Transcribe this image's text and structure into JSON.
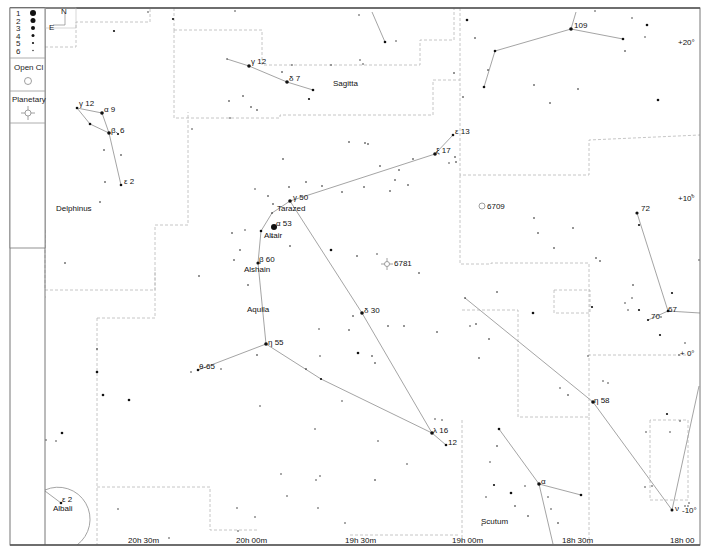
{
  "legend": {
    "magnitudes": [
      {
        "label": "1",
        "r": 3.0
      },
      {
        "label": "2",
        "r": 2.5
      },
      {
        "label": "3",
        "r": 2.0
      },
      {
        "label": "4",
        "r": 1.5
      },
      {
        "label": "5",
        "r": 1.1
      },
      {
        "label": "6",
        "r": 0.7
      }
    ],
    "open_cluster_label": "Open Cl",
    "planetary_label": "Planetary",
    "compass": {
      "north": "N",
      "east": "E"
    }
  },
  "axes": {
    "ra_labels": [
      {
        "text": "20h 30m",
        "x": 128,
        "y": 543
      },
      {
        "text": "20h 00m",
        "x": 236,
        "y": 543
      },
      {
        "text": "19h 30m",
        "x": 345,
        "y": 543
      },
      {
        "text": "19h 00m",
        "x": 452,
        "y": 543
      },
      {
        "text": "18h 30m",
        "x": 562,
        "y": 543
      },
      {
        "text": "18h 00",
        "x": 670,
        "y": 543
      }
    ],
    "dec_labels": [
      {
        "text": "+20°",
        "x": 678,
        "y": 45
      },
      {
        "text": "+10°",
        "x": 678,
        "y": 201
      },
      {
        "text": "+ 0°",
        "x": 680,
        "y": 356
      },
      {
        "text": "-10°",
        "x": 682,
        "y": 513
      }
    ]
  },
  "constellations": [
    {
      "name": "Delphinus",
      "x": 56,
      "y": 211
    },
    {
      "name": "Sagitta",
      "x": 333,
      "y": 86
    },
    {
      "name": "Aquila",
      "x": 247,
      "y": 312
    },
    {
      "name": "Scutum",
      "x": 481,
      "y": 524
    }
  ],
  "star_labels": [
    {
      "text": "γ 12",
      "x": 79,
      "y": 106
    },
    {
      "text": "α  9",
      "x": 104,
      "y": 112
    },
    {
      "text": "β. 6",
      "x": 111,
      "y": 133
    },
    {
      "text": "ε 2",
      "x": 124,
      "y": 184
    },
    {
      "text": "γ 12",
      "x": 251,
      "y": 64
    },
    {
      "text": "δ  7",
      "x": 289,
      "y": 81
    },
    {
      "text": "109",
      "x": 574,
      "y": 28
    },
    {
      "text": "ε 13",
      "x": 455,
      "y": 134
    },
    {
      "text": "ξ  17",
      "x": 436,
      "y": 153
    },
    {
      "text": "γ 50",
      "x": 293,
      "y": 200
    },
    {
      "text": "Tarazed",
      "x": 277,
      "y": 211
    },
    {
      "text": "α  53",
      "x": 276,
      "y": 226
    },
    {
      "text": "Altair",
      "x": 264,
      "y": 238
    },
    {
      "text": "β  60",
      "x": 259,
      "y": 262
    },
    {
      "text": "Alshain",
      "x": 244,
      "y": 272
    },
    {
      "text": "6709",
      "x": 487,
      "y": 209
    },
    {
      "text": "6781",
      "x": 394,
      "y": 266
    },
    {
      "text": "72",
      "x": 641,
      "y": 211
    },
    {
      "text": "67",
      "x": 668,
      "y": 312
    },
    {
      "text": "70",
      "x": 651,
      "y": 319
    },
    {
      "text": "δ  30",
      "x": 364,
      "y": 313
    },
    {
      "text": "η  55",
      "x": 268,
      "y": 345
    },
    {
      "text": "θ-65",
      "x": 199,
      "y": 369
    },
    {
      "text": "η  58",
      "x": 594,
      "y": 403
    },
    {
      "text": "λ  16",
      "x": 433,
      "y": 433
    },
    {
      "text": "12",
      "x": 448,
      "y": 445
    },
    {
      "text": "α",
      "x": 541,
      "y": 484
    },
    {
      "text": "ε 2",
      "x": 62,
      "y": 502
    },
    {
      "text": "Albali",
      "x": 53,
      "y": 511
    },
    {
      "text": "ν",
      "x": 675,
      "y": 511
    }
  ],
  "deep_sky": [
    {
      "type": "open-cluster",
      "id": "6709",
      "x": 482,
      "y": 206
    },
    {
      "type": "planetary-nebula",
      "id": "6781",
      "x": 387,
      "y": 264
    }
  ],
  "stars": [
    [
      77,
      108,
      1.3
    ],
    [
      102,
      113,
      1.8
    ],
    [
      90,
      124,
      1.3
    ],
    [
      109,
      133,
      1.8
    ],
    [
      118,
      134,
      1.1
    ],
    [
      104,
      150,
      0.8
    ],
    [
      121,
      155,
      0.8
    ],
    [
      121,
      185,
      1.3
    ],
    [
      105,
      182,
      0.8
    ],
    [
      100,
      202,
      0.8
    ],
    [
      65,
      263,
      0.8
    ],
    [
      114,
      31,
      1.1
    ],
    [
      148,
      12,
      0.7
    ],
    [
      227,
      59,
      0.7
    ],
    [
      249,
      66,
      1.8
    ],
    [
      287,
      82,
      1.8
    ],
    [
      313,
      90,
      1.3
    ],
    [
      282,
      72,
      0.8
    ],
    [
      309,
      99,
      1.1
    ],
    [
      229,
      101,
      0.8
    ],
    [
      243,
      96,
      0.8
    ],
    [
      251,
      107,
      0.8
    ],
    [
      257,
      110,
      0.8
    ],
    [
      230,
      118,
      0.7
    ],
    [
      192,
      129,
      0.7
    ],
    [
      173,
      19,
      1.1
    ],
    [
      235,
      11,
      0.7
    ],
    [
      385,
      42,
      1.3
    ],
    [
      396,
      41,
      0.7
    ],
    [
      359,
      15,
      0.7
    ],
    [
      331,
      65,
      0.7
    ],
    [
      360,
      60,
      0.7
    ],
    [
      363,
      64,
      0.7
    ],
    [
      292,
      65,
      0.7
    ],
    [
      467,
      20,
      1.3
    ],
    [
      475,
      38,
      0.8
    ],
    [
      488,
      70,
      0.8
    ],
    [
      495,
      51,
      1.3
    ],
    [
      484,
      87,
      1.3
    ],
    [
      571,
      29,
      1.8
    ],
    [
      623,
      39,
      1.3
    ],
    [
      632,
      18,
      0.7
    ],
    [
      647,
      25,
      1.3
    ],
    [
      645,
      37,
      0.7
    ],
    [
      625,
      51,
      0.8
    ],
    [
      658,
      100,
      1.3
    ],
    [
      534,
      85,
      0.8
    ],
    [
      578,
      89,
      0.8
    ],
    [
      550,
      103,
      0.8
    ],
    [
      463,
      97,
      0.8
    ],
    [
      454,
      73,
      0.8
    ],
    [
      595,
      11,
      0.7
    ],
    [
      453,
      135,
      1.3
    ],
    [
      435,
      154,
      1.8
    ],
    [
      455,
      157,
      0.8
    ],
    [
      456,
      162,
      0.8
    ],
    [
      449,
      163,
      0.7
    ],
    [
      413,
      159,
      0.8
    ],
    [
      399,
      170,
      0.8
    ],
    [
      395,
      180,
      0.8
    ],
    [
      349,
      142,
      0.8
    ],
    [
      368,
      144,
      0.8
    ],
    [
      365,
      143,
      0.8
    ],
    [
      380,
      166,
      0.8
    ],
    [
      283,
      159,
      0.8
    ],
    [
      289,
      187,
      0.8
    ],
    [
      306,
      182,
      0.8
    ],
    [
      408,
      185,
      0.8
    ],
    [
      390,
      191,
      0.8
    ],
    [
      364,
      187,
      0.8
    ],
    [
      322,
      186,
      0.8
    ],
    [
      342,
      192,
      0.8
    ],
    [
      290,
      201,
      1.8
    ],
    [
      273,
      204,
      0.8
    ],
    [
      268,
      196,
      0.8
    ],
    [
      255,
      189,
      0.7
    ],
    [
      272,
      213,
      0.8
    ],
    [
      272,
      237,
      0.7
    ],
    [
      261,
      231,
      1.3
    ],
    [
      245,
      230,
      0.7
    ],
    [
      274,
      227,
      3.0
    ],
    [
      258,
      263,
      1.6
    ],
    [
      240,
      250,
      0.8
    ],
    [
      234,
      260,
      0.8
    ],
    [
      290,
      246,
      0.8
    ],
    [
      331,
      250,
      1.3
    ],
    [
      357,
      256,
      0.8
    ],
    [
      377,
      254,
      0.7
    ],
    [
      419,
      273,
      0.8
    ],
    [
      248,
      285,
      0.8
    ],
    [
      199,
      276,
      0.8
    ],
    [
      232,
      233,
      0.8
    ],
    [
      534,
      218,
      0.8
    ],
    [
      573,
      228,
      0.8
    ],
    [
      497,
      292,
      0.8
    ],
    [
      538,
      233,
      0.8
    ],
    [
      554,
      248,
      0.8
    ],
    [
      600,
      261,
      0.8
    ],
    [
      637,
      213,
      1.6
    ],
    [
      639,
      225,
      1.1
    ],
    [
      596,
      258,
      0.8
    ],
    [
      633,
      285,
      0.8
    ],
    [
      639,
      310,
      1.1
    ],
    [
      668,
      311,
      1.3
    ],
    [
      648,
      320,
      1.1
    ],
    [
      625,
      303,
      0.7
    ],
    [
      628,
      310,
      0.7
    ],
    [
      632,
      298,
      0.7
    ],
    [
      592,
      307,
      1.1
    ],
    [
      672,
      293,
      1.1
    ],
    [
      661,
      317,
      0.7
    ],
    [
      660,
      335,
      1.1
    ],
    [
      679,
      355,
      0.7
    ],
    [
      685,
      343,
      0.7
    ],
    [
      692,
      195,
      0.7
    ],
    [
      699,
      260,
      0.7
    ],
    [
      465,
      298,
      0.8
    ],
    [
      476,
      324,
      0.8
    ],
    [
      470,
      326,
      0.7
    ],
    [
      489,
      339,
      0.8
    ],
    [
      479,
      358,
      0.8
    ],
    [
      533,
      313,
      1.3
    ],
    [
      568,
      395,
      0.8
    ],
    [
      588,
      356,
      0.7
    ],
    [
      603,
      381,
      0.7
    ],
    [
      608,
      383,
      0.7
    ],
    [
      362,
      313,
      1.8
    ],
    [
      353,
      316,
      0.8
    ],
    [
      349,
      330,
      0.8
    ],
    [
      388,
      326,
      0.8
    ],
    [
      358,
      353,
      1.3
    ],
    [
      372,
      356,
      0.8
    ],
    [
      375,
      363,
      0.8
    ],
    [
      404,
      326,
      0.8
    ],
    [
      437,
      332,
      0.8
    ],
    [
      319,
      329,
      0.7
    ],
    [
      320,
      356,
      0.7
    ],
    [
      266,
      344,
      1.8
    ],
    [
      257,
      355,
      0.8
    ],
    [
      306,
      369,
      0.8
    ],
    [
      321,
      379,
      1.1
    ],
    [
      342,
      401,
      0.7
    ],
    [
      198,
      370,
      1.3
    ],
    [
      191,
      372,
      0.7
    ],
    [
      221,
      369,
      0.7
    ],
    [
      260,
      406,
      0.7
    ],
    [
      315,
      429,
      0.7
    ],
    [
      378,
      441,
      0.7
    ],
    [
      432,
      433,
      1.8
    ],
    [
      446,
      445,
      1.3
    ],
    [
      442,
      420,
      0.7
    ],
    [
      435,
      419,
      0.7
    ],
    [
      97,
      349,
      0.8
    ],
    [
      97,
      372,
      1.3
    ],
    [
      103,
      395,
      1.3
    ],
    [
      129,
      400,
      1.3
    ],
    [
      62,
      433,
      1.3
    ],
    [
      56,
      441,
      0.7
    ],
    [
      46,
      440,
      0.7
    ],
    [
      593,
      402,
      1.8
    ],
    [
      560,
      388,
      0.7
    ],
    [
      667,
      414,
      1.1
    ],
    [
      680,
      421,
      0.7
    ],
    [
      646,
      432,
      0.7
    ],
    [
      670,
      432,
      0.7
    ],
    [
      645,
      487,
      0.7
    ],
    [
      652,
      486,
      0.7
    ],
    [
      499,
      429,
      1.3
    ],
    [
      497,
      446,
      0.8
    ],
    [
      494,
      485,
      1.1
    ],
    [
      511,
      493,
      1.3
    ],
    [
      525,
      486,
      0.7
    ],
    [
      539,
      484,
      1.8
    ],
    [
      548,
      497,
      0.7
    ],
    [
      581,
      495,
      1.3
    ],
    [
      515,
      506,
      0.8
    ],
    [
      528,
      516,
      0.8
    ],
    [
      551,
      509,
      0.7
    ],
    [
      558,
      523,
      0.8
    ],
    [
      490,
      462,
      0.7
    ],
    [
      486,
      497,
      0.7
    ],
    [
      482,
      525,
      0.7
    ],
    [
      375,
      480,
      0.8
    ],
    [
      320,
      476,
      0.7
    ],
    [
      316,
      480,
      0.7
    ],
    [
      318,
      508,
      0.7
    ],
    [
      281,
      474,
      0.7
    ],
    [
      407,
      464,
      0.7
    ],
    [
      345,
      523,
      0.7
    ],
    [
      238,
      531,
      0.7
    ],
    [
      255,
      517,
      0.7
    ],
    [
      169,
      538,
      0.7
    ],
    [
      287,
      496,
      0.7
    ],
    [
      61,
      503,
      1.3
    ],
    [
      118,
      509,
      0.7
    ],
    [
      237,
      508,
      0.7
    ],
    [
      672,
      510,
      1.5
    ],
    [
      685,
      506,
      0.7
    ],
    [
      688,
      506,
      0.7
    ],
    [
      689,
      503,
      0.7
    ]
  ],
  "figures": [
    [
      [
        77,
        108
      ],
      [
        102,
        113
      ],
      [
        109,
        133
      ],
      [
        121,
        185
      ]
    ],
    [
      [
        77,
        108
      ],
      [
        90,
        124
      ],
      [
        109,
        133
      ]
    ],
    [
      [
        227,
        59
      ],
      [
        249,
        66
      ],
      [
        287,
        82
      ],
      [
        313,
        90
      ]
    ],
    [
      [
        372,
        12
      ],
      [
        385,
        42
      ]
    ],
    [
      [
        484,
        87
      ],
      [
        495,
        51
      ],
      [
        571,
        29
      ],
      [
        623,
        39
      ]
    ],
    [
      [
        571,
        29
      ],
      [
        576,
        12
      ]
    ],
    [
      [
        453,
        135
      ],
      [
        435,
        154
      ],
      [
        290,
        201
      ],
      [
        272,
        213
      ],
      [
        261,
        231
      ],
      [
        258,
        263
      ],
      [
        266,
        344
      ],
      [
        198,
        370
      ]
    ],
    [
      [
        290,
        201
      ],
      [
        362,
        313
      ],
      [
        432,
        433
      ],
      [
        446,
        445
      ]
    ],
    [
      [
        266,
        344
      ],
      [
        321,
        379
      ],
      [
        432,
        433
      ]
    ],
    [
      [
        637,
        213
      ],
      [
        668,
        311
      ],
      [
        648,
        320
      ]
    ],
    [
      [
        668,
        311
      ],
      [
        700,
        313
      ]
    ],
    [
      [
        465,
        298
      ],
      [
        593,
        402
      ],
      [
        672,
        510
      ]
    ],
    [
      [
        672,
        510
      ],
      [
        699,
        386
      ]
    ],
    [
      [
        499,
        429
      ],
      [
        539,
        484
      ],
      [
        581,
        495
      ]
    ],
    [
      [
        539,
        484
      ],
      [
        553,
        544
      ]
    ],
    [
      [
        45,
        491
      ],
      [
        61,
        503
      ]
    ]
  ],
  "boundaries": [
    [
      [
        45,
        47
      ],
      [
        76,
        47
      ],
      [
        76,
        22
      ],
      [
        150,
        22
      ],
      [
        150,
        8
      ]
    ],
    [
      [
        174,
        8
      ],
      [
        174,
        30
      ]
    ],
    [
      [
        174,
        30
      ],
      [
        262,
        30
      ],
      [
        262,
        65
      ],
      [
        420,
        65
      ],
      [
        420,
        40
      ],
      [
        454,
        40
      ],
      [
        454,
        8
      ]
    ],
    [
      [
        174,
        30
      ],
      [
        174,
        118
      ],
      [
        280,
        118
      ],
      [
        280,
        115
      ],
      [
        433,
        115
      ],
      [
        433,
        80
      ],
      [
        460,
        80
      ]
    ],
    [
      [
        45,
        297
      ],
      [
        46,
        297
      ]
    ],
    [
      [
        460,
        8
      ],
      [
        460,
        175
      ],
      [
        589,
        175
      ],
      [
        589,
        140
      ],
      [
        700,
        135
      ]
    ],
    [
      [
        45,
        230
      ],
      [
        45,
        290
      ],
      [
        155,
        290
      ],
      [
        155,
        225
      ],
      [
        188,
        225
      ],
      [
        188,
        175
      ],
      [
        188,
        160
      ],
      [
        188,
        112
      ]
    ],
    [
      [
        97,
        318
      ],
      [
        155,
        318
      ],
      [
        155,
        270
      ]
    ],
    [
      [
        97,
        318
      ],
      [
        97,
        545
      ]
    ],
    [
      [
        460,
        175
      ],
      [
        460,
        264
      ],
      [
        491,
        264
      ],
      [
        491,
        263
      ],
      [
        589,
        263
      ],
      [
        589,
        355
      ],
      [
        690,
        355
      ]
    ],
    [
      [
        554,
        290
      ],
      [
        590,
        290
      ],
      [
        590,
        313
      ],
      [
        554,
        313
      ],
      [
        554,
        290
      ]
    ],
    [
      [
        462,
        310
      ],
      [
        518,
        310
      ],
      [
        518,
        417
      ],
      [
        589,
        417
      ],
      [
        589,
        355
      ]
    ],
    [
      [
        462,
        420
      ],
      [
        462,
        545
      ]
    ],
    [
      [
        589,
        417
      ],
      [
        589,
        545
      ]
    ],
    [
      [
        650,
        420
      ],
      [
        650,
        500
      ],
      [
        688,
        500
      ],
      [
        688,
        420
      ],
      [
        650,
        420
      ]
    ],
    [
      [
        97,
        487
      ],
      [
        210,
        487
      ],
      [
        210,
        530
      ],
      [
        258,
        530
      ]
    ],
    [
      [
        350,
        535
      ],
      [
        460,
        535
      ]
    ]
  ],
  "frame": {
    "x": 10,
    "y": 8,
    "w": 690,
    "h": 537,
    "legend_w": 35
  }
}
